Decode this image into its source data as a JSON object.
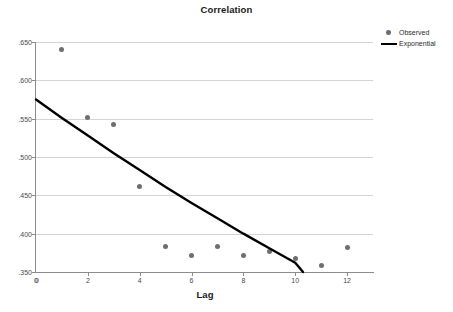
{
  "chart_data": {
    "type": "scatter",
    "title": "Correlation",
    "xlabel": "Lag",
    "ylabel": "",
    "xlim": [
      0,
      13
    ],
    "ylim": [
      0.35,
      0.65
    ],
    "grid": true,
    "legend_position": "top-right",
    "x_ticks": [
      "0",
      "2",
      "4",
      "6",
      "8",
      "10",
      "12"
    ],
    "x_tick_values": [
      0,
      2,
      4,
      6,
      8,
      10,
      12
    ],
    "y_ticks": [
      ".350",
      ".400",
      ".450",
      ".500",
      ".550",
      ".600",
      ".650"
    ],
    "y_tick_values": [
      0.35,
      0.4,
      0.45,
      0.5,
      0.55,
      0.6,
      0.65
    ],
    "origin_label": "0",
    "series": [
      {
        "name": "Observed",
        "type": "scatter",
        "color": "#6e6e6e",
        "x": [
          1,
          2,
          3,
          4,
          5,
          6,
          7,
          8,
          9,
          10,
          11,
          12
        ],
        "values": [
          0.64,
          0.552,
          0.543,
          0.461,
          0.383,
          0.372,
          0.383,
          0.372,
          0.377,
          0.368,
          0.358,
          0.382
        ]
      },
      {
        "name": "Exponential",
        "type": "line",
        "color": "#000000",
        "x": [
          0,
          1,
          2,
          3,
          4,
          5,
          6,
          7,
          8,
          9,
          10,
          10.3
        ],
        "values": [
          0.575,
          0.551,
          0.528,
          0.505,
          0.483,
          0.461,
          0.44,
          0.42,
          0.4,
          0.381,
          0.362,
          0.35
        ]
      }
    ],
    "legend": [
      {
        "label": "Observed",
        "marker": "dot",
        "color": "#6e6e6e"
      },
      {
        "label": "Exponential",
        "marker": "line",
        "color": "#000000"
      }
    ]
  }
}
